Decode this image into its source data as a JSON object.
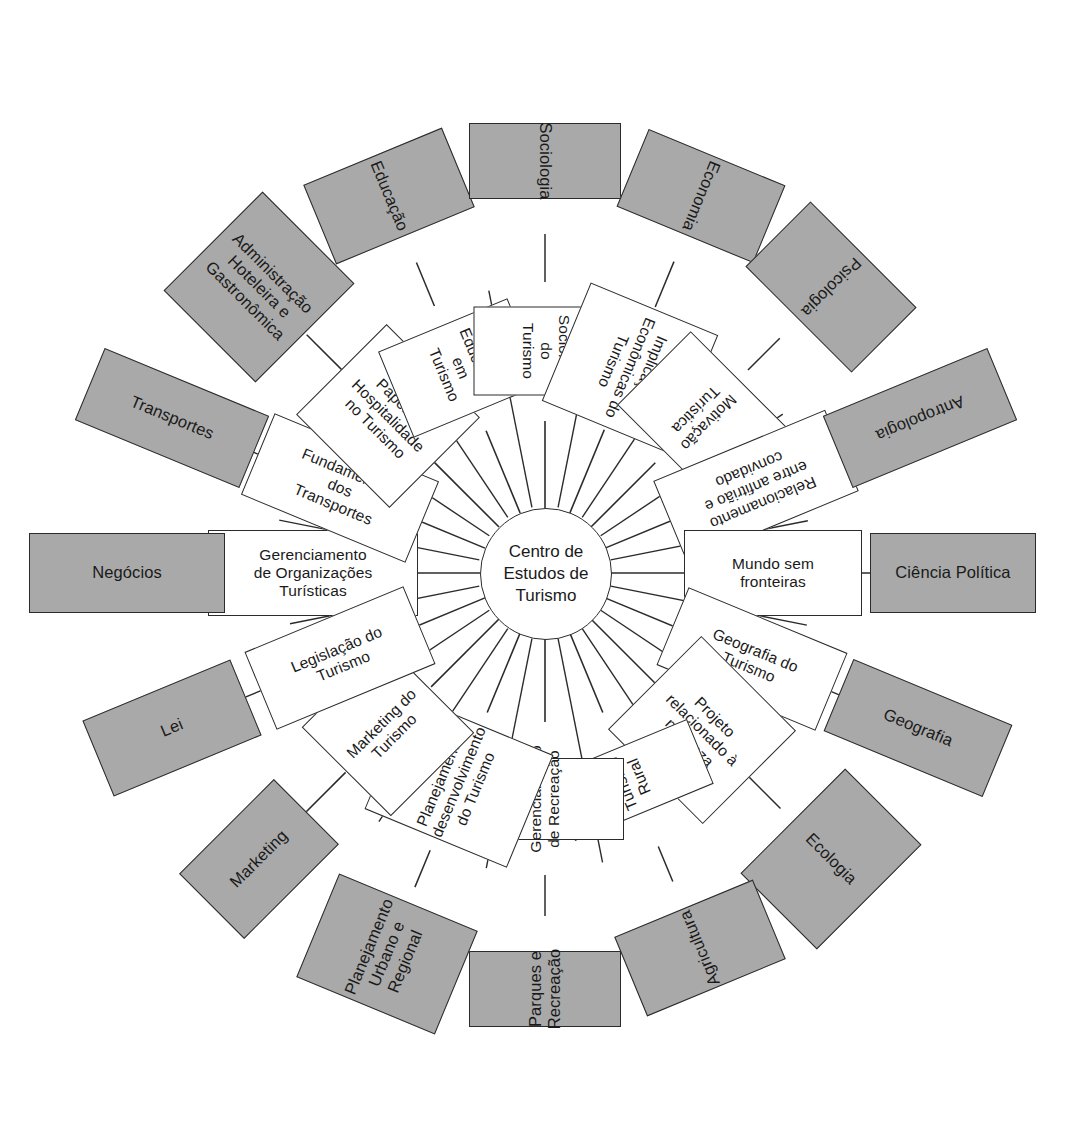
{
  "diagram": {
    "title_center": "Centro de\nEstudos de\nTurismo",
    "center": {
      "cx": 545,
      "cy": 573,
      "r": 65
    },
    "colors": {
      "inner_fill": "#ffffff",
      "outer_fill": "#a9a9a9",
      "stroke": "#2b2b2b",
      "background": "#ffffff",
      "text": "#1a1a1a"
    },
    "spokes": [
      {
        "angle": 180,
        "inner_label": "Gerenciamento\nde Organizações\nTurísticas",
        "outer_label": "Negócios",
        "inner_w": 210,
        "inner_h": 86,
        "inner_r": 232,
        "inner_rot": 0,
        "outer_w": 196,
        "outer_h": 80,
        "outer_r": 418,
        "outer_rot": 0
      },
      {
        "angle": 202.5,
        "inner_label": "Fundamentos\ndos\nTransportes",
        "outer_label": "Transportes",
        "inner_w": 178,
        "inner_h": 88,
        "inner_r": 222,
        "inner_rot": 22.5,
        "outer_w": 178,
        "outer_h": 78,
        "outer_r": 404,
        "outer_rot": 22.5
      },
      {
        "angle": 225,
        "inner_label": "Papel da\nHospitalidade\nno Turismo",
        "outer_label": "Administração\nHoteleira e\nGastronômica",
        "inner_w": 132,
        "inner_h": 128,
        "inner_r": 222,
        "inner_rot": 45,
        "outer_w": 130,
        "outer_h": 140,
        "outer_r": 404,
        "outer_rot": 45
      },
      {
        "angle": 247.5,
        "inner_label": "Educação em\nTurismo",
        "outer_label": "Educação",
        "inner_w": 93,
        "inner_h": 140,
        "inner_r": 222,
        "inner_rot": 67.5,
        "outer_w": 86,
        "outer_h": 150,
        "outer_r": 408,
        "outer_rot": 67.5
      },
      {
        "angle": 270,
        "inner_label": "Sociologia do\nTurismo",
        "outer_label": "Sociologia",
        "inner_w": 89,
        "inner_h": 144,
        "inner_r": 222,
        "inner_rot": 90,
        "outer_w": 76,
        "outer_h": 152,
        "outer_r": 412,
        "outer_rot": 90
      },
      {
        "angle": 292.5,
        "inner_label": "Implicações\nEconômicas do\nTurismo",
        "outer_label": "Economia",
        "inner_w": 128,
        "inner_h": 138,
        "inner_r": 222,
        "inner_rot": 112.5,
        "outer_w": 84,
        "outer_h": 148,
        "outer_r": 408,
        "outer_rot": 112.5
      },
      {
        "angle": 315,
        "inner_label": "Motivação\nTurística",
        "outer_label": "Psicologia",
        "inner_w": 104,
        "inner_h": 136,
        "inner_r": 222,
        "inner_rot": 135,
        "outer_w": 92,
        "outer_h": 150,
        "outer_r": 404,
        "outer_rot": 135
      },
      {
        "angle": 337.5,
        "inner_label": "Relacionamento\nentre anfitrião e\nconvidado",
        "outer_label": "Antropologia",
        "inner_w": 186,
        "inner_h": 88,
        "inner_r": 228,
        "inner_rot": 157.5,
        "outer_w": 178,
        "outer_h": 78,
        "outer_r": 406,
        "outer_rot": 157.5
      },
      {
        "angle": 0,
        "inner_label": "Mundo sem\nfronteiras",
        "outer_label": "Ciência Política",
        "inner_w": 178,
        "inner_h": 86,
        "inner_r": 228,
        "inner_rot": 0,
        "outer_w": 166,
        "outer_h": 80,
        "outer_r": 408,
        "outer_rot": 0
      },
      {
        "angle": 22.5,
        "inner_label": "Geografia do\nTurismo",
        "outer_label": "Geografia",
        "inner_w": 172,
        "inner_h": 84,
        "inner_r": 224,
        "inner_rot": 22.5,
        "outer_w": 172,
        "outer_h": 78,
        "outer_r": 404,
        "outer_rot": 22.5
      },
      {
        "angle": 45,
        "inner_label": "Projeto\nrelacionado à\nnatureza",
        "outer_label": "Ecologia",
        "inner_w": 134,
        "inner_h": 132,
        "inner_r": 222,
        "inner_rot": 45,
        "outer_w": 108,
        "outer_h": 148,
        "outer_r": 404,
        "outer_rot": 45
      },
      {
        "angle": 67.5,
        "inner_label": "Turismo Rural",
        "outer_label": "Agricultura",
        "inner_w": 70,
        "inner_h": 150,
        "inner_r": 224,
        "inner_rot": -112.5,
        "outer_w": 86,
        "outer_h": 150,
        "outer_r": 406,
        "outer_rot": -112.5
      },
      {
        "angle": 90,
        "inner_label": "Gerenciamento\nde Recreação",
        "outer_label": "Parques e\nRecreação",
        "inner_w": 82,
        "inner_h": 158,
        "inner_r": 226,
        "inner_rot": -90,
        "outer_w": 76,
        "outer_h": 152,
        "outer_r": 416,
        "outer_rot": -90
      },
      {
        "angle": 112.5,
        "inner_label": "Planejamento e\ndesenvolvimento\ndo Turismo",
        "outer_label": "Planejamento\nUrbano e\nRegional",
        "inner_w": 122,
        "inner_h": 154,
        "inner_r": 226,
        "inner_rot": -67.5,
        "outer_w": 112,
        "outer_h": 150,
        "outer_r": 412,
        "outer_rot": -67.5
      },
      {
        "angle": 135,
        "inner_label": "Marketing do\nTurismo",
        "outer_label": "Marketing",
        "inner_w": 118,
        "inner_h": 126,
        "inner_r": 222,
        "inner_rot": -45,
        "outer_w": 134,
        "outer_h": 92,
        "outer_r": 404,
        "outer_rot": -45
      },
      {
        "angle": 157.5,
        "inner_label": "Legislação do\nTurismo",
        "outer_label": "Lei",
        "inner_w": 172,
        "inner_h": 84,
        "inner_r": 222,
        "inner_rot": -22.5,
        "outer_w": 160,
        "outer_h": 82,
        "outer_r": 404,
        "outer_rot": -22.5
      }
    ]
  }
}
